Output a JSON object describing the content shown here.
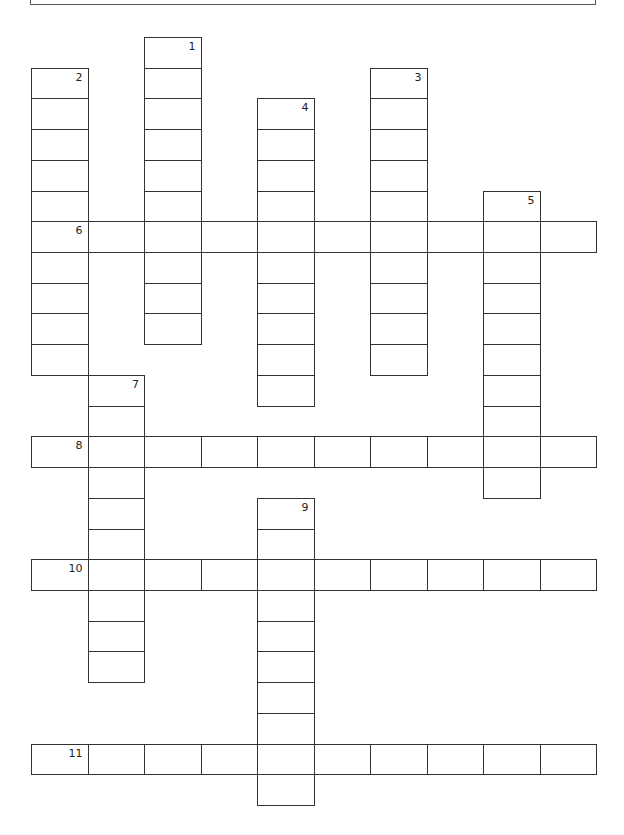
{
  "puzzle": {
    "type": "crossword",
    "grid": {
      "origin_x": 31,
      "origin_y": 37,
      "cell_w": 56.5,
      "cell_h": 30.72,
      "cols": 10,
      "rows": 25
    },
    "words": [
      {
        "number": "1",
        "direction": "down",
        "row": 0,
        "col": 2,
        "length": 10
      },
      {
        "number": "2",
        "direction": "down",
        "row": 1,
        "col": 0,
        "length": 10
      },
      {
        "number": "3",
        "direction": "down",
        "row": 1,
        "col": 6,
        "length": 10
      },
      {
        "number": "4",
        "direction": "down",
        "row": 2,
        "col": 4,
        "length": 10
      },
      {
        "number": "5",
        "direction": "down",
        "row": 5,
        "col": 8,
        "length": 10
      },
      {
        "number": "6",
        "direction": "across",
        "row": 6,
        "col": 0,
        "length": 10
      },
      {
        "number": "7",
        "direction": "down",
        "row": 11,
        "col": 1,
        "length": 10
      },
      {
        "number": "8",
        "direction": "across",
        "row": 13,
        "col": 0,
        "length": 10
      },
      {
        "number": "9",
        "direction": "down",
        "row": 15,
        "col": 4,
        "length": 10
      },
      {
        "number": "10",
        "direction": "across",
        "row": 17,
        "col": 0,
        "length": 10
      },
      {
        "number": "11",
        "direction": "across",
        "row": 23,
        "col": 0,
        "length": 10
      }
    ]
  }
}
